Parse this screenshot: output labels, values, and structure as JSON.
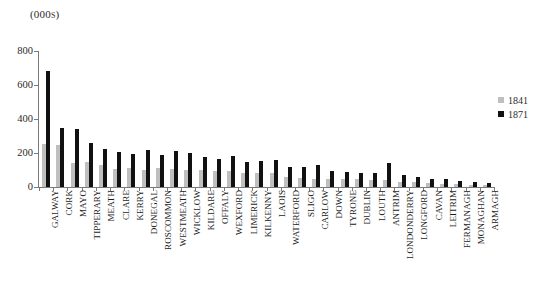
{
  "figure": {
    "cropped_title": "",
    "units_label": "(000s)"
  },
  "legend": {
    "position": "right",
    "entries": [
      {
        "label": "1841",
        "color": "#bfbfbf"
      },
      {
        "label": "1871",
        "color": "#111111"
      }
    ]
  },
  "axis": {
    "y_ticks": [
      "800",
      "600",
      "400",
      "200",
      "0"
    ]
  },
  "chart_data": {
    "type": "bar",
    "title": "",
    "subtitle": "(000s)",
    "xlabel": "",
    "ylabel": "(000s)",
    "ylim": [
      0,
      800
    ],
    "ytick_values": [
      0,
      200,
      400,
      600,
      800
    ],
    "grid": false,
    "legend_position": "right",
    "orientation": "vertical",
    "categories": [
      "GALWAY",
      "CORK",
      "MAYO",
      "TIPPERARY",
      "MEATH",
      "CLARE",
      "KERRY",
      "DONEGAL",
      "ROSCOMMON",
      "WESTMEATH",
      "WICKLOW",
      "KILDARE",
      "OFFALY",
      "WEXFORD",
      "LIMERICK",
      "KILKENNY",
      "LAOIS",
      "WATERFORD",
      "SLIGO",
      "CARLOW",
      "DOWN",
      "TYRONE",
      "DUBLIN",
      "LOUTH",
      "ANTRIM",
      "LONDONDERRY",
      "LONGFORD",
      "CAVAN",
      "LEITRIM",
      "FERMANAGH",
      "MONAGHAN",
      "ARMAGH"
    ],
    "series": [
      {
        "name": "1841",
        "color": "#bfbfbf",
        "values": [
          255,
          250,
          140,
          150,
          130,
          105,
          110,
          100,
          110,
          105,
          100,
          100,
          95,
          95,
          85,
          80,
          80,
          60,
          55,
          50,
          50,
          45,
          45,
          40,
          40,
          30,
          28,
          25,
          20,
          15,
          12,
          10
        ]
      },
      {
        "name": "1871",
        "color": "#111111",
        "values": [
          680,
          345,
          340,
          260,
          225,
          205,
          195,
          220,
          190,
          210,
          200,
          175,
          165,
          180,
          145,
          155,
          160,
          120,
          115,
          130,
          95,
          90,
          85,
          80,
          140,
          70,
          60,
          50,
          45,
          35,
          28,
          22
        ]
      }
    ]
  }
}
